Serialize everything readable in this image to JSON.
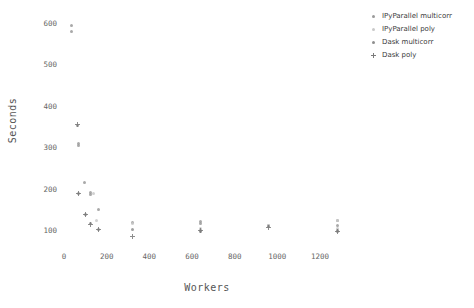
{
  "chart_data": {
    "type": "scatter",
    "title": "",
    "xlabel": "Workers",
    "ylabel": "Seconds",
    "xlim": [
      -60,
      1400
    ],
    "ylim": [
      60,
      640
    ],
    "xticks": [
      0,
      200,
      400,
      600,
      800,
      1000,
      1200
    ],
    "yticks": [
      100,
      200,
      300,
      400,
      500,
      600
    ],
    "grid": false,
    "legend_position": "upper right outside",
    "series": [
      {
        "name": "IPyParallel multicorr",
        "color": "#9a9a9a",
        "marker": "dot",
        "points": [
          [
            36,
            593
          ],
          [
            36,
            580
          ],
          [
            68,
            310
          ],
          [
            68,
            305
          ],
          [
            96,
            215
          ],
          [
            124,
            190
          ],
          [
            124,
            186
          ],
          [
            160,
            150
          ],
          [
            320,
            118
          ],
          [
            640,
            120
          ],
          [
            640,
            116
          ],
          [
            960,
            112
          ],
          [
            1280,
            122
          ],
          [
            1280,
            112
          ]
        ]
      },
      {
        "name": "IPyParallel poly",
        "color": "#c9c9c9",
        "marker": "dot",
        "points": [
          [
            140,
            189
          ],
          [
            152,
            124
          ],
          [
            320,
            116
          ],
          [
            640,
            104
          ],
          [
            960,
            110
          ],
          [
            1280,
            124
          ],
          [
            1280,
            104
          ]
        ]
      },
      {
        "name": "Dask multicorr",
        "color": "#8e8e8e",
        "marker": "dot",
        "points": [
          [
            64,
            353
          ],
          [
            68,
            188
          ],
          [
            100,
            138
          ],
          [
            124,
            115
          ],
          [
            160,
            102
          ],
          [
            320,
            101
          ],
          [
            640,
            100
          ],
          [
            640,
            96
          ],
          [
            960,
            108
          ],
          [
            1280,
            100
          ],
          [
            1280,
            97
          ]
        ]
      },
      {
        "name": "Dask poly",
        "color": "#7a7a7a",
        "marker": "plus",
        "points": [
          [
            64,
            354
          ],
          [
            68,
            189
          ],
          [
            100,
            137
          ],
          [
            124,
            114
          ],
          [
            160,
            101
          ],
          [
            320,
            84
          ],
          [
            640,
            98
          ],
          [
            960,
            107
          ],
          [
            1280,
            96
          ]
        ]
      }
    ]
  },
  "axes": {
    "ylabel": "Seconds",
    "xlabel": "Workers",
    "ytick_labels": [
      "600",
      "500",
      "400",
      "300",
      "200",
      "100"
    ],
    "xtick_labels": [
      "0",
      "200",
      "400",
      "600",
      "800",
      "1000",
      "1200"
    ]
  },
  "legend": {
    "items": [
      {
        "label": "IPyParallel multicorr",
        "color": "#9a9a9a"
      },
      {
        "label": "IPyParallel poly",
        "color": "#c9c9c9"
      },
      {
        "label": "Dask multicorr",
        "color": "#8e8e8e"
      },
      {
        "label": "Dask poly",
        "color": "#7a7a7a"
      }
    ]
  }
}
